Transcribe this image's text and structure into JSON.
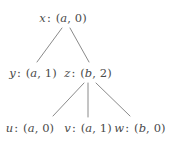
{
  "figure": {
    "type": "tree-diagram",
    "background_color": "#ffffff",
    "edge_color": "#8a8a8a",
    "text_color": "#4a4a4a"
  },
  "nodes": [
    {
      "id": "x",
      "name": "x",
      "label": "x : (a, 0)",
      "pair": "(a, 0)",
      "first": "a",
      "second": "0",
      "level": 0,
      "x": 63,
      "y": 19
    },
    {
      "id": "y",
      "name": "y",
      "label": "y : (a, 1)",
      "pair": "(a, 1)",
      "first": "a",
      "second": "1",
      "level": 1,
      "x": 33,
      "y": 74
    },
    {
      "id": "z",
      "name": "z",
      "label": "z : (b, 2)",
      "pair": "(b, 2)",
      "first": "b",
      "second": "2",
      "level": 1,
      "x": 88,
      "y": 74
    },
    {
      "id": "u",
      "name": "u",
      "label": "u : (a, 0)",
      "pair": "(a, 0)",
      "first": "a",
      "second": "0",
      "level": 2,
      "x": 30,
      "y": 129
    },
    {
      "id": "v",
      "name": "v",
      "label": "v : (a, 1)",
      "pair": "(a, 1)",
      "first": "a",
      "second": "1",
      "level": 2,
      "x": 88,
      "y": 129
    },
    {
      "id": "w",
      "name": "w",
      "label": "w : (b, 0)",
      "pair": "(b, 0)",
      "first": "b",
      "second": "0",
      "level": 2,
      "x": 140,
      "y": 129
    }
  ],
  "edges": [
    {
      "from": "x",
      "to": "y",
      "x1": 62,
      "y1": 28,
      "x2": 37,
      "y2": 62
    },
    {
      "from": "x",
      "to": "z",
      "x1": 70,
      "y1": 28,
      "x2": 89,
      "y2": 62
    },
    {
      "from": "z",
      "to": "u",
      "x1": 84,
      "y1": 83,
      "x2": 53,
      "y2": 116
    },
    {
      "from": "z",
      "to": "v",
      "x1": 88,
      "y1": 83,
      "x2": 88,
      "y2": 117
    },
    {
      "from": "z",
      "to": "w",
      "x1": 96,
      "y1": 83,
      "x2": 130,
      "y2": 116
    }
  ]
}
